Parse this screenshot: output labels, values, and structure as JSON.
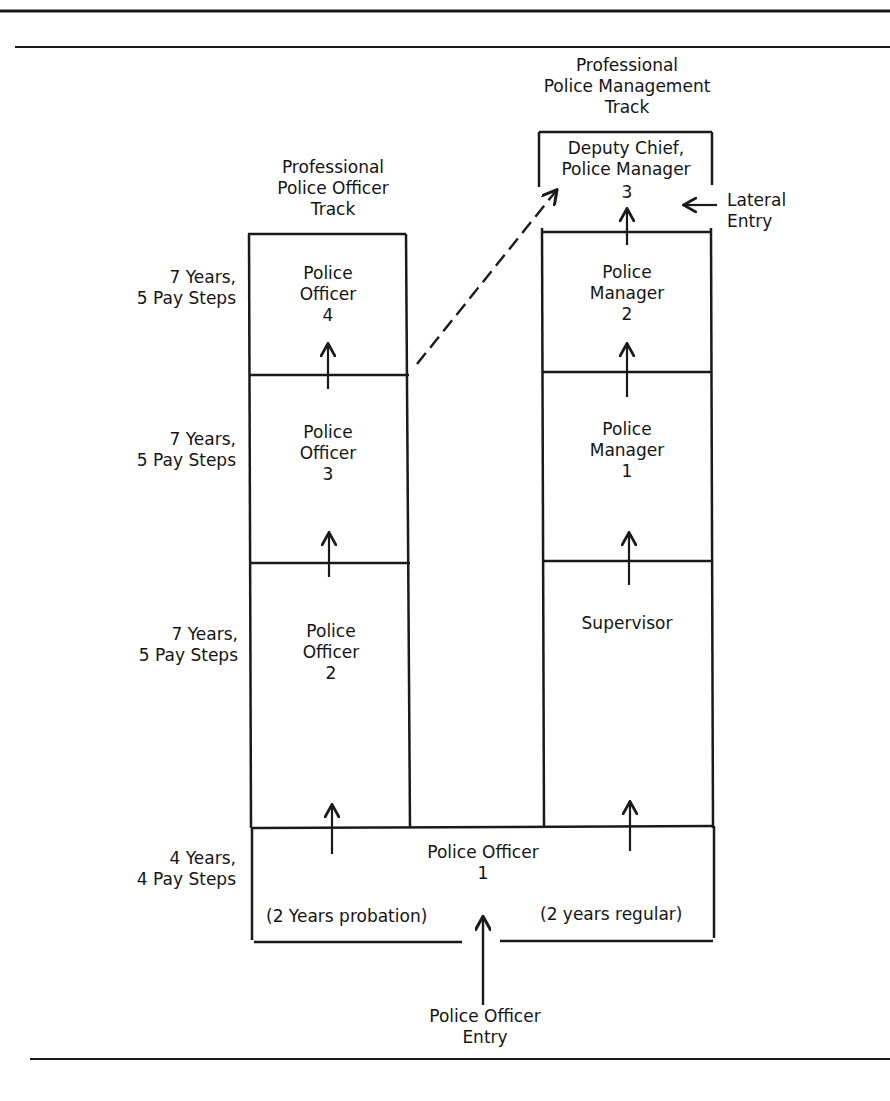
{
  "header": {
    "cut_off_caption": "Figure — Career development tracks"
  },
  "tracks": {
    "officer_track_label": "Professional\nPolice Officer\nTrack",
    "management_track_label": "Professional\nPolice Management\nTrack"
  },
  "officer_track": {
    "levels": [
      {
        "title": "Police\nOfficer\n4",
        "duration": "7 Years,\n5 Pay Steps"
      },
      {
        "title": "Police\nOfficer\n3",
        "duration": "7 Years,\n5 Pay Steps"
      },
      {
        "title": "Police\nOfficer\n2",
        "duration": "7 Years,\n5 Pay Steps"
      }
    ]
  },
  "management_track": {
    "top": {
      "title": "Deputy Chief,\nPolice Manager",
      "number": "3"
    },
    "levels": [
      {
        "title": "Police\nManager\n2"
      },
      {
        "title": "Police\nManager\n1"
      },
      {
        "title": "Supervisor"
      }
    ],
    "lateral_entry": "Lateral\nEntry"
  },
  "base_level": {
    "title": "Police Officer\n1",
    "duration": "4 Years,\n4 Pay Steps",
    "probation_note": "(2 Years probation)",
    "regular_note": "(2 years regular)"
  },
  "entry": {
    "label": "Police Officer\nEntry"
  },
  "colors": {
    "line": "#1a1a1a",
    "background": "#ffffff"
  }
}
